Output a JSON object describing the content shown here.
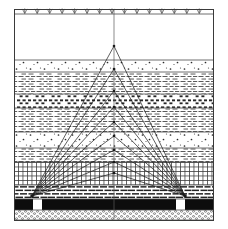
{
  "figure": {
    "width": 228,
    "height": 229,
    "background_color": "#ffffff",
    "frame": {
      "x": 14,
      "y": 9,
      "width": 199,
      "height": 211,
      "stroke_color": "#3a3a3a"
    }
  },
  "surface": {
    "name": "ground-surface",
    "y": 14,
    "symbol": "vegetation-tuft",
    "symbol_count": 15,
    "description": "Row of grass/vegetation tuft symbols along the topographic surface line"
  },
  "center_axis": {
    "name": "center-vertical-axis",
    "x": 114,
    "y_top": 9,
    "y_bottom": 220,
    "stroke_color": "#5a5a5a"
  },
  "shot_points": [
    {
      "label": "source-left",
      "x": 32,
      "y": 196
    },
    {
      "label": "receiver-right",
      "x": 185,
      "y": 196
    }
  ],
  "reflection_points": [
    {
      "index": 1,
      "x": 114,
      "y": 46
    },
    {
      "index": 2,
      "x": 114,
      "y": 69
    },
    {
      "index": 3,
      "x": 114,
      "y": 91
    },
    {
      "index": 4,
      "x": 114,
      "y": 107
    },
    {
      "index": 5,
      "x": 114,
      "y": 122
    },
    {
      "index": 6,
      "x": 114,
      "y": 136
    },
    {
      "index": 7,
      "x": 114,
      "y": 150
    },
    {
      "index": 8,
      "x": 114,
      "y": 162
    },
    {
      "index": 9,
      "x": 114,
      "y": 173
    }
  ],
  "chart_data": {
    "type": "line",
    "xlabel": "",
    "ylabel": "Depth",
    "xlim": [
      14,
      213
    ],
    "ylim": [
      220,
      9
    ],
    "grid": false,
    "legend_position": "none",
    "series": [
      {
        "name": "ray-pair-1",
        "x": [
          32,
          114,
          185
        ],
        "y": [
          196,
          46,
          196
        ]
      },
      {
        "name": "ray-pair-2",
        "x": [
          32,
          114,
          185
        ],
        "y": [
          196,
          69,
          196
        ]
      },
      {
        "name": "ray-pair-3",
        "x": [
          32,
          114,
          185
        ],
        "y": [
          196,
          91,
          196
        ]
      },
      {
        "name": "ray-pair-4",
        "x": [
          32,
          114,
          185
        ],
        "y": [
          196,
          107,
          196
        ]
      },
      {
        "name": "ray-pair-5",
        "x": [
          32,
          114,
          185
        ],
        "y": [
          196,
          122,
          196
        ]
      },
      {
        "name": "ray-pair-6",
        "x": [
          32,
          114,
          185
        ],
        "y": [
          196,
          136,
          196
        ]
      },
      {
        "name": "ray-pair-7",
        "x": [
          32,
          114,
          185
        ],
        "y": [
          196,
          150,
          196
        ]
      },
      {
        "name": "ray-pair-8",
        "x": [
          32,
          114,
          185
        ],
        "y": [
          196,
          162,
          196
        ]
      },
      {
        "name": "ray-pair-9",
        "x": [
          32,
          114,
          185
        ],
        "y": [
          196,
          173,
          196
        ]
      }
    ],
    "annotations": [
      "Ground surface with vegetation symbols at top",
      "Nine reflecting horizons at increasing depth",
      "Rays converge at two surface stations (left source, right receiver)",
      "Black coal/shale bed near base with two white cased-borehole gaps"
    ]
  },
  "layers": [
    {
      "index": 0,
      "name": "air-blank-zone",
      "pattern": "blank",
      "y_top": 14,
      "y_bottom": 60,
      "fill_color": "#ffffff",
      "description": "Unpatterned white zone above first marker horizon"
    },
    {
      "index": 1,
      "name": "sandstone-dotted-a",
      "pattern": "dots",
      "y_top": 60,
      "y_bottom": 72,
      "fill_color": "#ffffff",
      "description": "Dotted sandstone unit"
    },
    {
      "index": 2,
      "name": "shale-dashed-a",
      "pattern": "dashes",
      "y_top": 72,
      "y_bottom": 94,
      "fill_color": "#ffffff",
      "description": "Fine dashed shale / siltstone unit"
    },
    {
      "index": 3,
      "name": "conglomerate-blocky",
      "pattern": "blocks",
      "y_top": 94,
      "y_bottom": 108,
      "fill_color": "#ffffff",
      "description": "Coarse blocky conglomeratic unit"
    },
    {
      "index": 4,
      "name": "shale-dashed-b",
      "pattern": "dashes",
      "y_top": 108,
      "y_bottom": 132,
      "fill_color": "#ffffff",
      "description": "Dashed shale unit"
    },
    {
      "index": 5,
      "name": "sandstone-dotted-b",
      "pattern": "dots",
      "y_top": 132,
      "y_bottom": 148,
      "fill_color": "#ffffff",
      "description": "Dotted sandstone unit"
    },
    {
      "index": 6,
      "name": "siltstone-dashed-c",
      "pattern": "dashes",
      "y_top": 148,
      "y_bottom": 162,
      "fill_color": "#ffffff",
      "description": "Dashed siltstone unit"
    },
    {
      "index": 7,
      "name": "limestone-grid",
      "pattern": "grid",
      "y_top": 162,
      "y_bottom": 185,
      "fill_color": "#ffffff",
      "description": "Cross-hatched / gridded limestone unit"
    },
    {
      "index": 8,
      "name": "brick-limestone",
      "pattern": "brick",
      "y_top": 185,
      "y_bottom": 199,
      "fill_color": "#ffffff",
      "description": "Brick-pattern limestone / dolomite"
    },
    {
      "index": 9,
      "name": "coal-seam",
      "pattern": "solid",
      "y_top": 199,
      "y_bottom": 210,
      "fill_color": "#0d0d0d",
      "description": "Solid black coal seam with two white borehole gaps"
    },
    {
      "index": 10,
      "name": "basement-stipple",
      "pattern": "stipple",
      "y_top": 210,
      "y_bottom": 220,
      "fill_color": "#ffffff",
      "description": "Dense stippled basement / breccia unit"
    }
  ],
  "borehole_gaps": [
    {
      "name": "borehole-gap-left",
      "x": 33,
      "y": 199,
      "width": 9,
      "height": 11,
      "fill_color": "#ffffff"
    },
    {
      "name": "borehole-gap-right",
      "x": 176,
      "y": 199,
      "width": 9,
      "height": 11,
      "fill_color": "#ffffff"
    }
  ],
  "colors": {
    "ink": "#1a1a1a",
    "frame": "#3a3a3a",
    "layer_rule": "#4a4a4a",
    "coal": "#0d0d0d",
    "paper": "#ffffff"
  }
}
